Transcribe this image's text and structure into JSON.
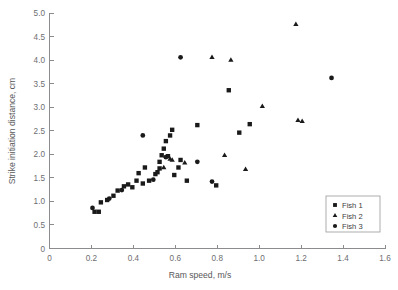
{
  "chart_data": {
    "type": "scatter",
    "title": "",
    "xlabel": "Ram speed, m/s",
    "ylabel": "Strike initiation distance, cm",
    "xlim": [
      0,
      1.6
    ],
    "ylim": [
      0,
      5.0
    ],
    "xticks": [
      0,
      0.2,
      0.4,
      0.6,
      0.8,
      1.0,
      1.2,
      1.4,
      1.6
    ],
    "xtick_labels": [
      "0",
      "0.2",
      "0.4",
      "0.6",
      "0.8",
      "1.0",
      "1.2",
      "1.4",
      "1.6"
    ],
    "yticks": [
      0,
      0.5,
      1.0,
      1.5,
      2.0,
      2.5,
      3.0,
      3.5,
      4.0,
      4.5,
      5.0
    ],
    "ytick_labels": [
      "0",
      "0.5",
      "1.0",
      "1.5",
      "2.0",
      "2.5",
      "3.0",
      "3.5",
      "4.0",
      "4.5",
      "5.0"
    ],
    "grid": false,
    "legend_position": "lower-right",
    "series": [
      {
        "name": "Fish 1",
        "marker": "square",
        "color": "#1a1a1a",
        "points": [
          [
            0.215,
            0.78
          ],
          [
            0.235,
            0.78
          ],
          [
            0.245,
            0.98
          ],
          [
            0.275,
            1.03
          ],
          [
            0.305,
            1.12
          ],
          [
            0.325,
            1.23
          ],
          [
            0.355,
            1.32
          ],
          [
            0.375,
            1.36
          ],
          [
            0.395,
            1.3
          ],
          [
            0.415,
            1.44
          ],
          [
            0.425,
            1.6
          ],
          [
            0.445,
            1.38
          ],
          [
            0.455,
            1.72
          ],
          [
            0.475,
            1.44
          ],
          [
            0.505,
            1.58
          ],
          [
            0.515,
            1.62
          ],
          [
            0.525,
            1.7
          ],
          [
            0.525,
            1.84
          ],
          [
            0.535,
            1.98
          ],
          [
            0.545,
            2.12
          ],
          [
            0.555,
            2.28
          ],
          [
            0.565,
            1.96
          ],
          [
            0.575,
            2.4
          ],
          [
            0.585,
            2.52
          ],
          [
            0.595,
            1.56
          ],
          [
            0.615,
            1.72
          ],
          [
            0.625,
            1.88
          ],
          [
            0.655,
            1.44
          ],
          [
            0.705,
            2.62
          ],
          [
            0.795,
            1.34
          ],
          [
            0.855,
            3.36
          ],
          [
            0.905,
            2.46
          ],
          [
            0.955,
            2.64
          ]
        ]
      },
      {
        "name": "Fish 2",
        "marker": "triangle",
        "color": "#1a1a1a",
        "points": [
          [
            0.545,
            1.72
          ],
          [
            0.575,
            1.9
          ],
          [
            0.585,
            1.88
          ],
          [
            0.645,
            1.82
          ],
          [
            0.775,
            4.06
          ],
          [
            0.835,
            1.98
          ],
          [
            0.865,
            4.0
          ],
          [
            0.935,
            1.68
          ],
          [
            1.015,
            3.02
          ],
          [
            1.175,
            4.76
          ],
          [
            1.185,
            2.72
          ],
          [
            1.205,
            2.7
          ]
        ]
      },
      {
        "name": "Fish 3",
        "marker": "circle",
        "color": "#1a1a1a",
        "points": [
          [
            0.205,
            0.86
          ],
          [
            0.285,
            1.06
          ],
          [
            0.345,
            1.24
          ],
          [
            0.445,
            2.4
          ],
          [
            0.495,
            1.46
          ],
          [
            0.555,
            1.94
          ],
          [
            0.625,
            4.06
          ],
          [
            0.705,
            1.84
          ],
          [
            0.775,
            1.42
          ],
          [
            1.345,
            3.62
          ]
        ]
      }
    ]
  },
  "legend": {
    "entries": [
      {
        "label": "Fish 1",
        "marker": "square"
      },
      {
        "label": "Fish 2",
        "marker": "triangle"
      },
      {
        "label": "Fish 3",
        "marker": "circle"
      }
    ]
  }
}
